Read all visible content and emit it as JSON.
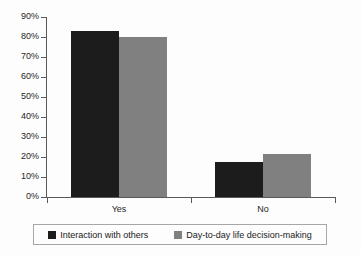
{
  "chart_data": {
    "type": "bar",
    "title": "",
    "xlabel": "",
    "ylabel": "",
    "categories": [
      "Yes",
      "No"
    ],
    "series": [
      {
        "name": "Interaction with others",
        "color": "#1c1c1c",
        "values": [
          83,
          17.5
        ]
      },
      {
        "name": "Day-to-day life decision-making",
        "color": "#808080",
        "values": [
          80,
          21.5
        ]
      }
    ],
    "ylim": [
      0,
      90
    ],
    "ytick_values": [
      0,
      10,
      20,
      30,
      40,
      50,
      60,
      70,
      80,
      90
    ],
    "ytick_labels": [
      "0%",
      "10%",
      "20%",
      "30%",
      "40%",
      "50%",
      "60%",
      "70%",
      "80%",
      "90%"
    ],
    "grid": false,
    "legend_position": "bottom",
    "value_suffix": "%"
  },
  "axes": {
    "y_axis_name": "percentage-axis",
    "x_axis_name": "category-axis"
  }
}
